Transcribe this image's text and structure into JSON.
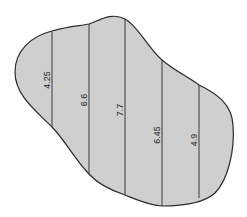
{
  "diagram": {
    "type": "irregular-area-with-offsets",
    "fill_color": "#cfcfcf",
    "stroke_color": "#2a2a2a",
    "offsets": [
      {
        "label": "4.25",
        "x": 52,
        "y_top": 31,
        "y_bottom": 127,
        "label_y": 80
      },
      {
        "label": "6.6",
        "x": 89,
        "y_top": 24,
        "y_bottom": 174,
        "label_y": 100
      },
      {
        "label": "7.7",
        "x": 125,
        "y_top": 19,
        "y_bottom": 195,
        "label_y": 110
      },
      {
        "label": "6.45",
        "x": 162,
        "y_top": 60,
        "y_bottom": 206,
        "label_y": 135
      },
      {
        "label": "4.9",
        "x": 199,
        "y_top": 85,
        "y_bottom": 198,
        "label_y": 140
      }
    ]
  }
}
